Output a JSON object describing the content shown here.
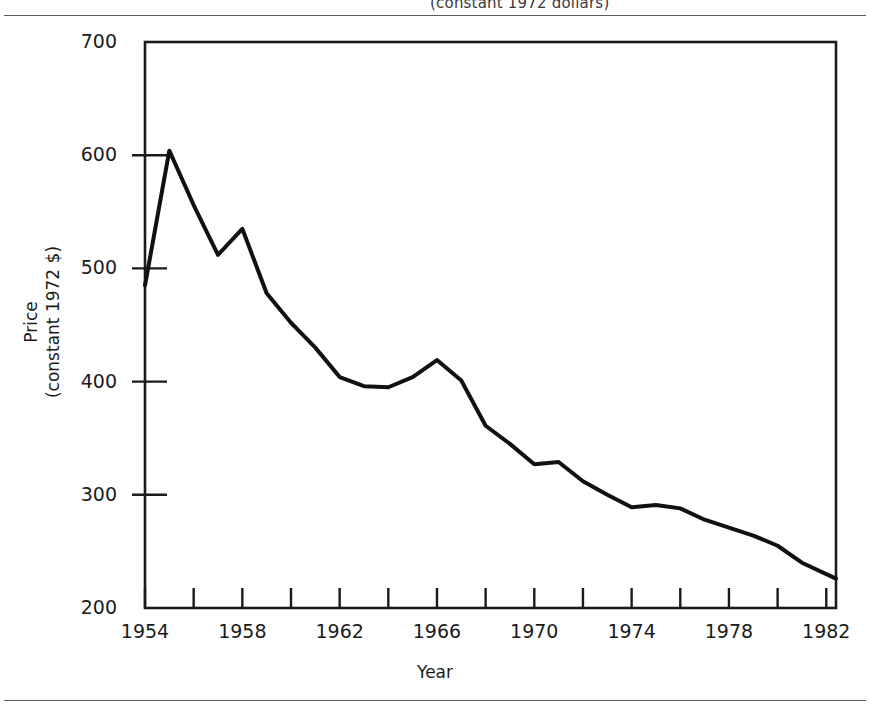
{
  "figure": {
    "caption_fragment": "(constant 1972 dollars)",
    "rules": [
      "top-rule",
      "bottom-rule"
    ]
  },
  "chart_data": {
    "type": "line",
    "title": "",
    "xlabel": "Year",
    "ylabel": "Price (constant 1972 $)",
    "ylabel_line1": "Price",
    "ylabel_line2": "(constant 1972 $)",
    "xlim": [
      1954,
      1982.4
    ],
    "ylim": [
      200,
      700
    ],
    "grid": false,
    "legend": "none",
    "yticks": [
      200,
      300,
      400,
      500,
      600,
      700
    ],
    "ytick_labels": [
      "200",
      "300",
      "400",
      "500",
      "600",
      "700"
    ],
    "xticks": [
      1954,
      1956,
      1958,
      1960,
      1962,
      1964,
      1966,
      1968,
      1970,
      1972,
      1974,
      1976,
      1978,
      1980,
      1982
    ],
    "xtick_labels_shown": [
      "1954",
      "1958",
      "1962",
      "1966",
      "1970",
      "1974",
      "1978",
      "1982"
    ],
    "xtick_labels_shown_at": [
      1954,
      1958,
      1962,
      1966,
      1970,
      1974,
      1978,
      1982
    ],
    "line_color": "#111111",
    "line_width": 4,
    "x": [
      1954,
      1955,
      1956,
      1957,
      1958,
      1959,
      1960,
      1961,
      1962,
      1963,
      1964,
      1965,
      1966,
      1967,
      1968,
      1969,
      1970,
      1971,
      1972,
      1973,
      1974,
      1975,
      1976,
      1977,
      1978,
      1979,
      1980,
      1981,
      1982.4
    ],
    "values": [
      485,
      604,
      556,
      512,
      535,
      478,
      452,
      430,
      404,
      396,
      395,
      404,
      419,
      401,
      361,
      345,
      327,
      329,
      312,
      300,
      289,
      291,
      288,
      278,
      271,
      264,
      255,
      240,
      226
    ],
    "series": [
      {
        "name": "Price (constant 1972 $)",
        "values": [
          485,
          604,
          556,
          512,
          535,
          478,
          452,
          430,
          404,
          396,
          395,
          404,
          419,
          401,
          361,
          345,
          327,
          329,
          312,
          300,
          289,
          291,
          288,
          278,
          271,
          264,
          255,
          240,
          226
        ]
      }
    ],
    "annotations": []
  }
}
